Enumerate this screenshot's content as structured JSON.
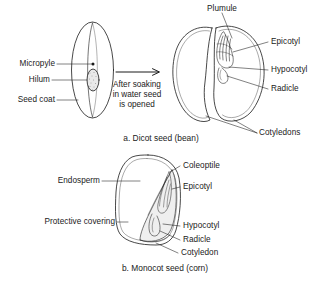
{
  "figure": {
    "background_color": "#ffffff",
    "ink_color": "#1a1a1a"
  },
  "panel_a": {
    "caption": "a. Dicot seed (bean)",
    "process_text_line1": "After soaking",
    "process_text_line2": "in water seed",
    "process_text_line3": "is opened",
    "arrow_name": "process-arrow",
    "left_labels": [
      {
        "id": "micropyle",
        "text": "Micropyle"
      },
      {
        "id": "hilum",
        "text": "Hilum"
      },
      {
        "id": "seed-coat",
        "text": "Seed coat"
      }
    ],
    "right_labels": [
      {
        "id": "epicotyl",
        "text": "Epicotyl"
      },
      {
        "id": "hypocotyl",
        "text": "Hypocotyl"
      },
      {
        "id": "radicle",
        "text": "Radicle"
      }
    ],
    "top_label": {
      "id": "plumule",
      "text": "Plumule"
    },
    "bottom_label": {
      "id": "cotyledons",
      "text": "Cotyledons"
    }
  },
  "panel_b": {
    "caption": "b. Monocot seed (corn)",
    "left_labels": [
      {
        "id": "endosperm",
        "text": "Endosperm"
      },
      {
        "id": "protective-covering",
        "text": "Protective covering"
      }
    ],
    "right_labels": [
      {
        "id": "coleoptile",
        "text": "Coleoptile"
      },
      {
        "id": "epicotyl",
        "text": "Epicotyl"
      },
      {
        "id": "hypocotyl",
        "text": "Hypocotyl"
      },
      {
        "id": "radicle",
        "text": "Radicle"
      },
      {
        "id": "cotyledon",
        "text": "Cotyledon"
      }
    ]
  }
}
